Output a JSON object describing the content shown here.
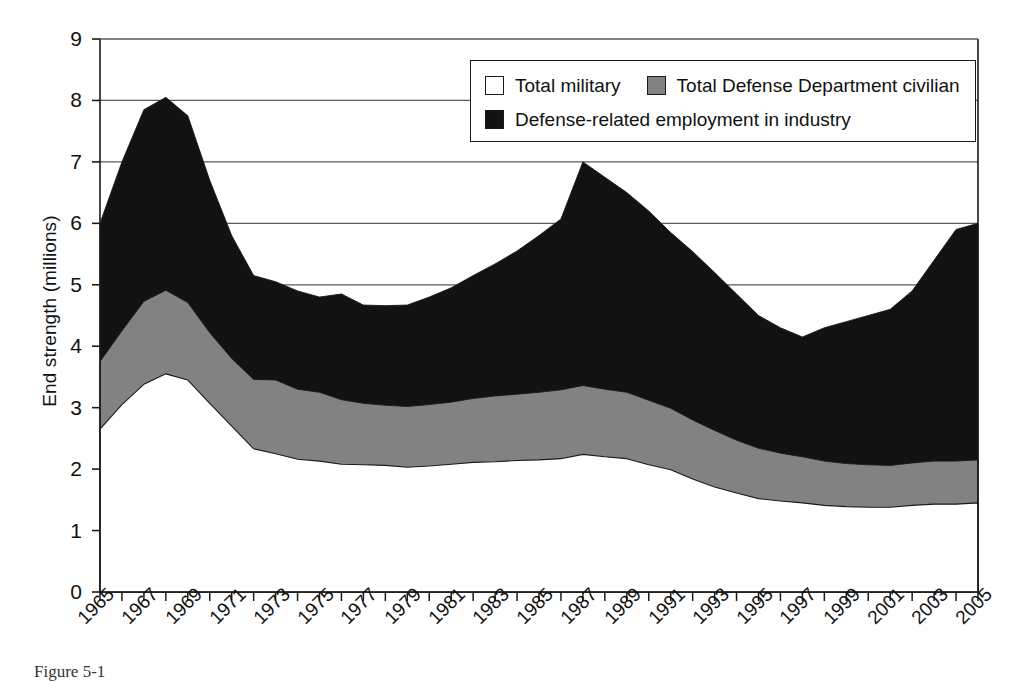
{
  "chart_data": {
    "type": "area",
    "stacked": true,
    "title": "",
    "xlabel": "",
    "ylabel": "End strength (millions)",
    "ylim": [
      0,
      9
    ],
    "xlim": [
      1965,
      2005
    ],
    "grid": "horizontal",
    "legend_position": "top-right",
    "y_ticks": [
      "0",
      "1",
      "2",
      "3",
      "4",
      "5",
      "6",
      "7",
      "8",
      "9"
    ],
    "x_tick_labels": [
      "1965",
      "1967",
      "1969",
      "1971",
      "1973",
      "1975",
      "1977",
      "1979",
      "1981",
      "1983",
      "1985",
      "1987",
      "1989",
      "1991",
      "1993",
      "1995",
      "1997",
      "1999",
      "2001",
      "2003",
      "2005"
    ],
    "x": [
      1965,
      1966,
      1967,
      1968,
      1969,
      1970,
      1971,
      1972,
      1973,
      1974,
      1975,
      1976,
      1977,
      1978,
      1979,
      1980,
      1981,
      1982,
      1983,
      1984,
      1985,
      1986,
      1987,
      1988,
      1989,
      1990,
      1991,
      1992,
      1993,
      1994,
      1995,
      1996,
      1997,
      1998,
      1999,
      2000,
      2001,
      2002,
      2003,
      2004,
      2005
    ],
    "series": [
      {
        "name": "Total military",
        "color": "#ffffff",
        "values": [
          2.65,
          3.05,
          3.38,
          3.55,
          3.45,
          3.07,
          2.7,
          2.33,
          2.25,
          2.16,
          2.13,
          2.08,
          2.07,
          2.06,
          2.03,
          2.05,
          2.08,
          2.11,
          2.12,
          2.14,
          2.15,
          2.17,
          2.24,
          2.2,
          2.17,
          2.07,
          1.99,
          1.84,
          1.71,
          1.61,
          1.52,
          1.48,
          1.45,
          1.41,
          1.39,
          1.38,
          1.38,
          1.41,
          1.43,
          1.43,
          1.45
        ]
      },
      {
        "name": "Total Defense Department civilian",
        "color": "#828282",
        "values": [
          1.1,
          1.2,
          1.35,
          1.36,
          1.26,
          1.15,
          1.1,
          1.13,
          1.2,
          1.14,
          1.12,
          1.05,
          1.0,
          0.98,
          0.99,
          1.0,
          1.01,
          1.04,
          1.07,
          1.08,
          1.1,
          1.12,
          1.12,
          1.1,
          1.08,
          1.05,
          1.0,
          0.96,
          0.92,
          0.86,
          0.82,
          0.78,
          0.75,
          0.72,
          0.7,
          0.69,
          0.68,
          0.69,
          0.7,
          0.7,
          0.7
        ]
      },
      {
        "name": "Defense-related employment in industry",
        "color": "#121212",
        "values": [
          2.25,
          2.75,
          3.12,
          3.14,
          3.04,
          2.48,
          2.0,
          1.69,
          1.6,
          1.6,
          1.55,
          1.72,
          1.6,
          1.62,
          1.65,
          1.75,
          1.86,
          2.0,
          2.15,
          2.33,
          2.55,
          2.78,
          3.64,
          3.45,
          3.25,
          3.08,
          2.86,
          2.74,
          2.57,
          2.38,
          2.16,
          2.04,
          1.95,
          2.17,
          2.31,
          2.43,
          2.54,
          2.8,
          3.27,
          3.77,
          3.85
        ]
      }
    ]
  },
  "axis": {
    "y_title": "End strength (millions)"
  },
  "legend": {
    "items": [
      {
        "label": "Total military",
        "swatch": "white-swatch"
      },
      {
        "label": "Total Defense Department civilian",
        "swatch": "gray-swatch"
      },
      {
        "label": "Defense-related employment in industry",
        "swatch": "black-swatch"
      }
    ]
  },
  "caption": {
    "text": "Figure 5-1"
  },
  "colors": {
    "military": "#ffffff",
    "civilian": "#828282",
    "industry": "#121212",
    "axis": "#1a1a1a",
    "grid": "#5a5a5a"
  }
}
